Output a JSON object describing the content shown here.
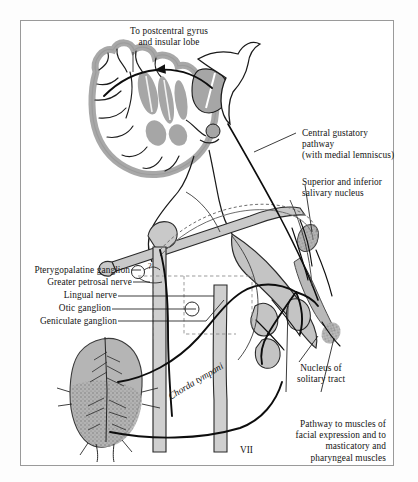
{
  "figure": {
    "frame_color": "#9a9a9a",
    "background": "#ffffff",
    "ink_color": "#141414",
    "tissue_gray": "#a8a8a8",
    "tissue_gray_light": "#c4c4c4"
  },
  "labels": {
    "top_callout": "To postcentral gyrus\nand insular lobe",
    "central_gustatory": "Central gustatory\npathway\n(with medial lemniscus)",
    "salivary_nucleus": "Superior and inferior\nsalivary nucleus",
    "pterygopalatine": "Pterygopalatine ganglion",
    "greater_petrosal": "Greater petrosal nerve",
    "lingual": "Lingual nerve",
    "otic": "Otic ganglion",
    "geniculate": "Geniculate ganglion",
    "chorda_tympani": "Chorda tympani",
    "nucleus_solitary": "Nucleus of\nsolitary tract",
    "pathway_muscles": "Pathway to muscles of\nfacial expression and to\nmasticatory and\npharyngeal muscles",
    "nerve_seven": "VII",
    "query_marker": "?"
  }
}
